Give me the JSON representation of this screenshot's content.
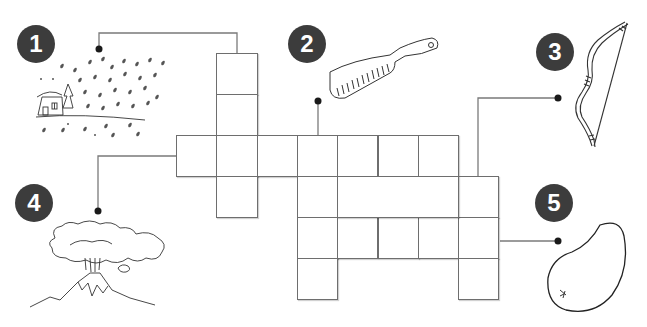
{
  "puzzle": {
    "type": "picture-crossword",
    "cell_size_px": 40,
    "grid_origin": {
      "x": 176,
      "y": 53
    },
    "cells": [
      {
        "row": 0,
        "col": 1
      },
      {
        "row": 1,
        "col": 1
      },
      {
        "row": 2,
        "col": 0
      },
      {
        "row": 2,
        "col": 1
      },
      {
        "row": 2,
        "col": 2
      },
      {
        "row": 2,
        "col": 3
      },
      {
        "row": 2,
        "col": 4
      },
      {
        "row": 2,
        "col": 5
      },
      {
        "row": 2,
        "col": 6
      },
      {
        "row": 3,
        "col": 1
      },
      {
        "row": 3,
        "col": 3
      },
      {
        "row": 3,
        "col": 7
      },
      {
        "row": 4,
        "col": 3
      },
      {
        "row": 4,
        "col": 4
      },
      {
        "row": 4,
        "col": 5
      },
      {
        "row": 4,
        "col": 6
      },
      {
        "row": 4,
        "col": 7
      },
      {
        "row": 5,
        "col": 3
      },
      {
        "row": 5,
        "col": 7
      }
    ],
    "filler_boxes": [
      {
        "row": 3,
        "col": 4,
        "span": 3
      }
    ]
  },
  "clues": [
    {
      "number": "1",
      "picture": "snowfall-over-house",
      "badge": {
        "x": 17,
        "y": 25
      }
    },
    {
      "number": "2",
      "picture": "comb",
      "badge": {
        "x": 288,
        "y": 25
      }
    },
    {
      "number": "3",
      "picture": "bow",
      "badge": {
        "x": 536,
        "y": 33
      }
    },
    {
      "number": "4",
      "picture": "volcano",
      "badge": {
        "x": 15,
        "y": 184
      }
    },
    {
      "number": "5",
      "picture": "potato",
      "badge": {
        "x": 535,
        "y": 184
      }
    }
  ],
  "colors": {
    "badge": "#3c3c3c",
    "badge_text": "#ffffff",
    "grid_line": "#6e6e6e",
    "connector": "#7a7a7a",
    "dot": "#1a1a1a"
  }
}
